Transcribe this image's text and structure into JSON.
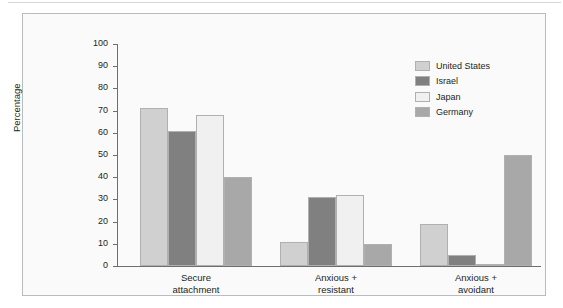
{
  "chart_data": {
    "type": "bar",
    "title": "",
    "xlabel": "",
    "ylabel": "Percentage",
    "ylim": [
      0,
      100
    ],
    "yticks": [
      0,
      10,
      20,
      30,
      40,
      50,
      60,
      70,
      80,
      90,
      100
    ],
    "ytick_labels": [
      "0",
      "10",
      "20",
      "30",
      "40",
      "50",
      "60",
      "70",
      "80",
      "90",
      "100"
    ],
    "grid": false,
    "legend_position": "top-right",
    "categories": [
      "Secure attachment",
      "Anxious + resistant",
      "Anxious + avoidant"
    ],
    "category_lines": [
      [
        "Secure",
        "attachment"
      ],
      [
        "Anxious +",
        "resistant"
      ],
      [
        "Anxious +",
        "avoidant"
      ]
    ],
    "series": [
      {
        "name": "United States",
        "color": "#d0d0d0",
        "values": [
          71,
          11,
          19
        ]
      },
      {
        "name": "Israel",
        "color": "#808080",
        "values": [
          61,
          31,
          5
        ]
      },
      {
        "name": "Japan",
        "color": "#f0f0f0",
        "values": [
          68,
          32,
          1
        ]
      },
      {
        "name": "Germany",
        "color": "#a8a8a8",
        "values": [
          40,
          10,
          50
        ]
      }
    ]
  },
  "figure": {
    "panel_background": "#fafafa",
    "panel_border": "#b9bcbd",
    "axis_color": "#6e6e6e",
    "text_color": "#231f20"
  }
}
